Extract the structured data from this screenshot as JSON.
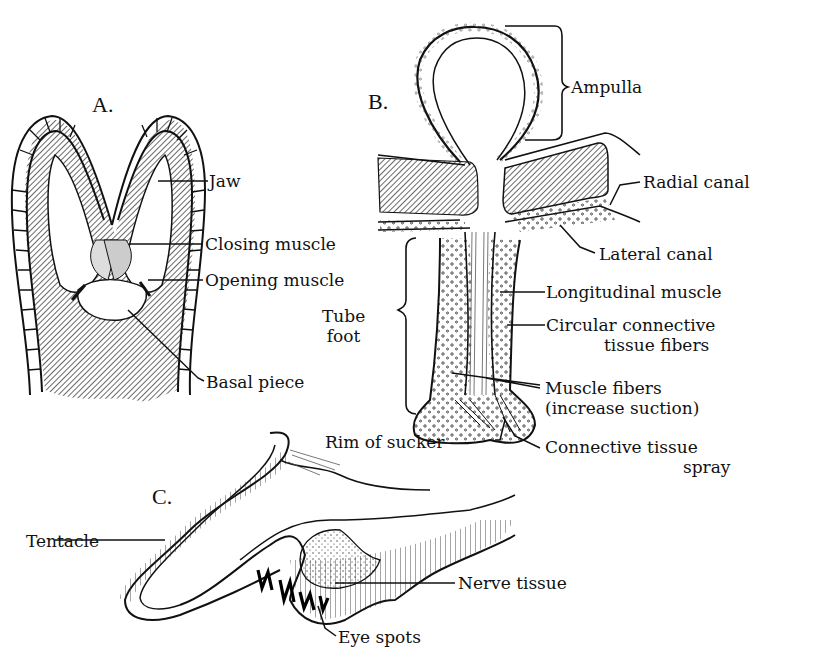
{
  "figure": {
    "panels": [
      {
        "id": "A",
        "label": "A.",
        "subject": "Jaw apparatus (Aristotle's lantern tooth)"
      },
      {
        "id": "B",
        "label": "B.",
        "subject": "Tube foot and ampulla"
      },
      {
        "id": "C",
        "label": "C.",
        "subject": "Tentacle with eye spots"
      }
    ],
    "labels": {
      "A": {
        "jaw": "Jaw",
        "closing_muscle": "Closing muscle",
        "opening_muscle": "Opening muscle",
        "basal_piece": "Basal piece"
      },
      "B": {
        "ampulla": "Ampulla",
        "radial_canal": "Radial canal",
        "lateral_canal": "Lateral canal",
        "longitudinal_muscle": "Longitudinal muscle",
        "circular_line1": "Circular connective",
        "circular_line2": "tissue fibers",
        "tube_line1": "Tube",
        "tube_line2": "foot",
        "muscle_fibers_line1": "Muscle fibers",
        "muscle_fibers_line2": "(increase suction)",
        "rim_of_sucker": "Rim of sucker",
        "connective_spray_line1": "Connective tissue",
        "connective_spray_line2": "spray"
      },
      "C": {
        "tentacle": "Tentacle",
        "nerve_tissue": "Nerve tissue",
        "eye_spots": "Eye spots"
      }
    },
    "colors": {
      "ink": "#111111",
      "background": "#ffffff",
      "hatch": "#555555"
    }
  }
}
